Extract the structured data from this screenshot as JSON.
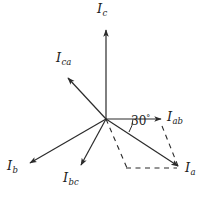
{
  "figure": {
    "type": "phasor-diagram",
    "background_color": "#ffffff",
    "stroke_color": "#2b2b2b",
    "width": 211,
    "height": 201,
    "origin": {
      "x": 106,
      "y": 119
    }
  },
  "angle": {
    "value": "30",
    "degree_symbol": "°",
    "between": [
      "I_ab",
      "I_a"
    ]
  },
  "phasors": [
    {
      "id": "Ic",
      "symbol": "I",
      "subscript": "c",
      "style": "solid",
      "tip": {
        "x": 106,
        "y": 28
      },
      "label_pos": {
        "x": 97,
        "y": 2
      }
    },
    {
      "id": "Ica",
      "symbol": "I",
      "subscript": "ca",
      "style": "solid",
      "tip": {
        "x": 66,
        "y": 76
      },
      "label_pos": {
        "x": 57,
        "y": 52
      }
    },
    {
      "id": "Iab",
      "symbol": "I",
      "subscript": "ab",
      "style": "solid",
      "tip": {
        "x": 163,
        "y": 119
      },
      "label_pos": {
        "x": 167,
        "y": 110
      }
    },
    {
      "id": "Ia",
      "symbol": "I",
      "subscript": "a",
      "style": "solid",
      "tip": {
        "x": 180,
        "y": 168
      },
      "label_pos": {
        "x": 184,
        "y": 162
      }
    },
    {
      "id": "Ib",
      "symbol": "I",
      "subscript": "b",
      "style": "solid",
      "tip": {
        "x": 28,
        "y": 165
      },
      "label_pos": {
        "x": 6,
        "y": 160
      }
    },
    {
      "id": "Ibc",
      "symbol": "I",
      "subscript": "bc",
      "style": "solid",
      "tip": {
        "x": 80,
        "y": 167
      },
      "label_pos": {
        "x": 63,
        "y": 172
      }
    }
  ],
  "construction_lines": [
    {
      "id": "origin-to-corner",
      "style": "dashed",
      "from": {
        "x": 106,
        "y": 119
      },
      "to": {
        "x": 127,
        "y": 168
      }
    },
    {
      "id": "corner-to-Ia",
      "style": "dashed",
      "from": {
        "x": 127,
        "y": 168
      },
      "to": {
        "x": 177,
        "y": 168
      }
    },
    {
      "id": "Iab-to-Ia",
      "style": "dashed",
      "from": {
        "x": 162,
        "y": 126
      },
      "to": {
        "x": 178,
        "y": 166
      }
    }
  ]
}
